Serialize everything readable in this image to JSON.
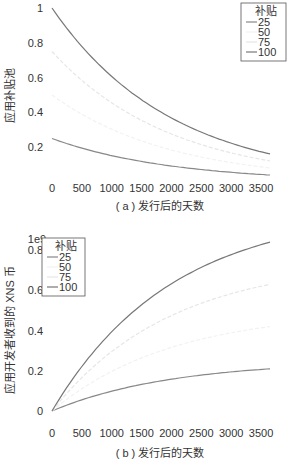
{
  "chart_data": [
    {
      "type": "line",
      "title": "",
      "caption": "( a ) 发行后的天数",
      "xlabel": "( a ) 发行后的天数",
      "ylabel": "应用补贴池",
      "x_ticks": [
        "0",
        "500",
        "1000",
        "1500",
        "2000",
        "2500",
        "3000",
        "3500"
      ],
      "y_ticks": [
        "0.2",
        "0.4",
        "0.6",
        "0.8",
        "1"
      ],
      "xlim": [
        0,
        3650
      ],
      "ylim": [
        0,
        1.05
      ],
      "grid": false,
      "legend": {
        "title": "补贴",
        "position": "upper right",
        "entries": [
          "25",
          "50",
          "75",
          "100"
        ]
      },
      "x": [
        0,
        500,
        1000,
        1500,
        2000,
        2500,
        3000,
        3650
      ],
      "series": [
        {
          "name": "25",
          "color": "#888888",
          "values": [
            0.25,
            0.195,
            0.152,
            0.118,
            0.092,
            0.072,
            0.056,
            0.04
          ]
        },
        {
          "name": "50",
          "color": "#f2f2f2",
          "values": [
            0.5,
            0.39,
            0.303,
            0.236,
            0.184,
            0.143,
            0.112,
            0.08
          ]
        },
        {
          "name": "75",
          "color": "#e6e6e6",
          "values": [
            0.75,
            0.584,
            0.455,
            0.354,
            0.276,
            0.215,
            0.167,
            0.12
          ]
        },
        {
          "name": "100",
          "color": "#777777",
          "values": [
            1.0,
            0.779,
            0.607,
            0.472,
            0.368,
            0.287,
            0.223,
            0.16
          ]
        }
      ]
    },
    {
      "type": "line",
      "title": "",
      "caption": "( b ) 发行后的天数",
      "xlabel": "( b ) 发行后的天数",
      "ylabel": "应用开发者收到的 XNS 币",
      "y_scale_label": "1e9",
      "x_ticks": [
        "0",
        "500",
        "1000",
        "1500",
        "2000",
        "2500",
        "3000",
        "3500"
      ],
      "y_ticks": [
        "0",
        "0.2",
        "0.4",
        "0.6",
        "0.8"
      ],
      "xlim": [
        0,
        3650
      ],
      "ylim": [
        0,
        0.85
      ],
      "grid": false,
      "legend": {
        "title": "补贴",
        "position": "upper left",
        "entries": [
          "25",
          "50",
          "75",
          "100"
        ]
      },
      "x": [
        0,
        500,
        1000,
        1500,
        2000,
        2500,
        3000,
        3650
      ],
      "series": [
        {
          "name": "25",
          "color": "#888888",
          "values": [
            0,
            0.055,
            0.098,
            0.132,
            0.158,
            0.178,
            0.194,
            0.21
          ]
        },
        {
          "name": "50",
          "color": "#f2f2f2",
          "values": [
            0,
            0.11,
            0.197,
            0.264,
            0.316,
            0.357,
            0.388,
            0.42
          ]
        },
        {
          "name": "75",
          "color": "#e6e6e6",
          "values": [
            0,
            0.166,
            0.295,
            0.396,
            0.474,
            0.535,
            0.583,
            0.63
          ]
        },
        {
          "name": "100",
          "color": "#777777",
          "values": [
            0,
            0.221,
            0.393,
            0.528,
            0.632,
            0.713,
            0.777,
            0.84
          ]
        }
      ]
    }
  ]
}
